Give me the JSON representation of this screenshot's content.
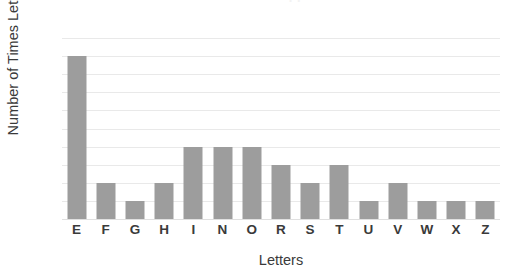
{
  "chart_data": {
    "type": "bar",
    "title": "Number of Times Letter Appears in Name",
    "xlabel": "Letters",
    "ylabel": "Number of Times Letter Appears",
    "categories": [
      "E",
      "F",
      "G",
      "H",
      "I",
      "N",
      "O",
      "R",
      "S",
      "T",
      "U",
      "V",
      "W",
      "X",
      "Z"
    ],
    "values": [
      9,
      2,
      1,
      2,
      4,
      4,
      4,
      3,
      2,
      3,
      1,
      2,
      1,
      1,
      1
    ],
    "ylim": [
      0,
      10
    ],
    "ytick_labels": [
      "10",
      "9",
      "8",
      "7",
      "6",
      "5",
      "4",
      "3",
      "2",
      "1",
      "0"
    ],
    "ytick_values": [
      10,
      9,
      8,
      7,
      6,
      5,
      4,
      3,
      2,
      1,
      0
    ],
    "grid": true,
    "legend": "none",
    "bar_color": "#9d9d9d",
    "gridline_color": "#e9e9e9",
    "background_color": "#ffffff",
    "text_color": "#3a3a3a"
  }
}
